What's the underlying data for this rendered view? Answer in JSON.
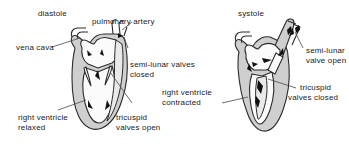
{
  "figure": {
    "type": "diagram",
    "panels": [
      {
        "id": "diastole",
        "title": "diastole",
        "labels": [
          {
            "name": "vena-cava",
            "text": "vena cava"
          },
          {
            "name": "pulmonary-artery",
            "text": "pulmonary artery"
          },
          {
            "name": "semi-lunar-valves-closed",
            "text": "semi-lunar valves\nclosed"
          },
          {
            "name": "tricuspid-valves-open",
            "text": "tricuspid\nvalves open"
          },
          {
            "name": "right-ventricle-relaxed",
            "text": "right ventricle\nrelaxed"
          }
        ]
      },
      {
        "id": "systole",
        "title": "systole",
        "labels": [
          {
            "name": "semi-lunar-valve-open",
            "text": "semi-lunar\nvalve open"
          },
          {
            "name": "tricuspid-valves-closed",
            "text": "tricuspid\nvalves closed"
          },
          {
            "name": "right-ventricle-contracted",
            "text": "right ventricle\ncontracted"
          }
        ]
      }
    ]
  },
  "panel_left": {
    "title": "diastole",
    "vena_cava": "vena cava",
    "pulmonary_artery": "pulmonary artery",
    "semilunar_line1": "semi-lunar valves",
    "semilunar_line2": "closed",
    "tricuspid_line1": "tricuspid",
    "tricuspid_line2": "valves open",
    "ventricle_line1": "right ventricle",
    "ventricle_line2": "relaxed"
  },
  "panel_right": {
    "title": "systole",
    "semilunar_line1": "semi-lunar",
    "semilunar_line2": "valve open",
    "tricuspid_line1": "tricuspid",
    "tricuspid_line2": "valves closed",
    "ventricle_line1": "right ventricle",
    "ventricle_line2": "contracted"
  },
  "colors": {
    "background": "#ffffff",
    "outline": "#2b2b2b",
    "muscle_wall": "#cfcfcf",
    "chamber": "#fbfbfb",
    "valve": "#111111",
    "text": "#1a1a1a",
    "leader_line": "#4a4a4a"
  }
}
